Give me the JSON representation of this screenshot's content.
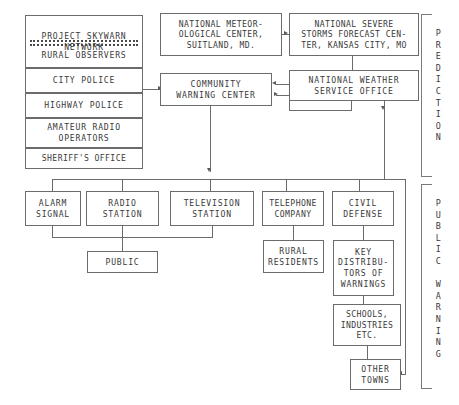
{
  "diagram": {
    "background_color": "#ffffff",
    "line_color": "#6b6b6b",
    "text_color": "#3a3a3a"
  },
  "sources": {
    "skywarn_network": "PROJECT SKYWARN\nNETWORK",
    "rural_observers": "RURAL OBSERVERS",
    "city_police": "CITY POLICE",
    "highway_police": "HIGHWAY POLICE",
    "amateur_radio": "AMATEUR RADIO\nOPERATORS",
    "sheriffs_office": "SHERIFF'S OFFICE"
  },
  "prediction": {
    "national_meteorological_center": "NATIONAL METEOR-\nOLOGICAL CENTER,\nSUITLAND, MD.",
    "national_severe_storms": "NATIONAL SEVERE\nSTORMS FORECAST CEN-\nTER, KANSAS CITY, MO",
    "national_weather_service": "NATIONAL WEATHER\nSERVICE OFFICE",
    "community_warning_center": "COMMUNITY\nWARNING CENTER"
  },
  "dissemination": {
    "alarm_signal": "ALARM\nSIGNAL",
    "radio_station": "RADIO\nSTATION",
    "television_station": "TELEVISION\nSTATION",
    "telephone_company": "TELEPHONE\nCOMPANY",
    "civil_defense": "CIVIL\nDEFENSE",
    "public": "PUBLIC",
    "rural_residents": "RURAL\nRESIDENTS",
    "key_distributors": "KEY\nDISTRIBU-\nTORS OF\nWARNINGS",
    "schools_industries": "SCHOOLS,\nINDUSTRIES\nETC.",
    "other_towns": "OTHER\nTOWNS"
  },
  "side_labels": {
    "prediction": "P\nR\nE\nD\nI\nC\nT\nI\nO\nN",
    "public_warning": "P\nU\nB\nL\nI\nC\n\nW\nA\nR\nN\nI\nN\nG"
  }
}
